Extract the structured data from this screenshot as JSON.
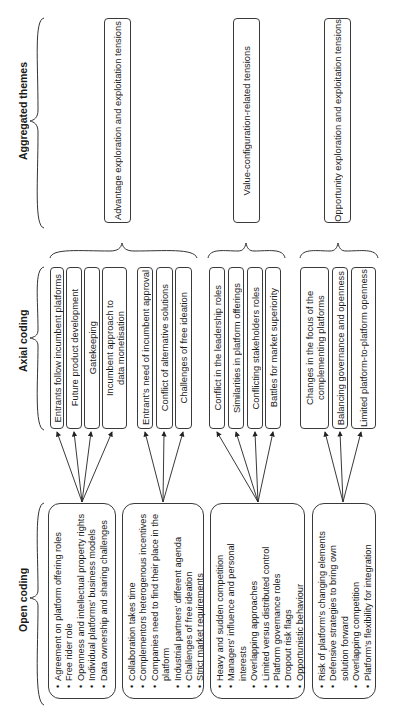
{
  "headers": {
    "open_coding": "Open coding",
    "axial_coding": "Axial coding",
    "aggregated_themes": "Aggregated themes"
  },
  "aggregated_themes": [
    "Advantage exploration and exploitation tensions",
    "Value-configuration-related tensions",
    "Opportunity exploration and exploitation tensions"
  ],
  "axial_groups": [
    {
      "codes": [
        "Entrants follow incumbent platforms",
        "Future product development",
        "Gatekeeping",
        "Incumbent approach to data monetisation"
      ]
    },
    {
      "codes": [
        "Entrant's need of incumbent approval",
        "Conflict of alternative solutions",
        "Challenges of free ideation"
      ]
    },
    {
      "codes": [
        "Conflict in the leadership roles",
        "Similarities in platform offerings",
        "Conflicting stakeholders roles",
        "Battles for market superiority"
      ]
    },
    {
      "codes": [
        "Changes in the focus of the complementing platforms",
        "Balancing governance and openness",
        "Limited platform-to-platform openness"
      ]
    }
  ],
  "open_groups": [
    {
      "items": [
        "Agreement on platform offering roles",
        "Free rider role",
        "Openness and intellectual property rights",
        "Individual platforms' business models",
        "Data ownership and sharing challenges"
      ]
    },
    {
      "items": [
        "Collaboration takes time",
        "Complementors heterogenous incentives",
        "Companies need to find their place in the platform",
        "Industrial partners' different agenda",
        "Challenges of free ideation",
        "Strict market requirements"
      ]
    },
    {
      "items": [
        "Heavy and sudden competition",
        "Managers' influence and personal interests",
        "Overlapping approaches",
        "Limited versus distributed control",
        "Platform governance roles",
        "Dropout risk flags",
        "Opportunistic behaviour"
      ]
    },
    {
      "items": [
        "Risk of platform's changing elements",
        "Defensive strategies to bring own solution forward",
        "Overlapping competition",
        "Platform's flexibility for integration"
      ]
    }
  ]
}
